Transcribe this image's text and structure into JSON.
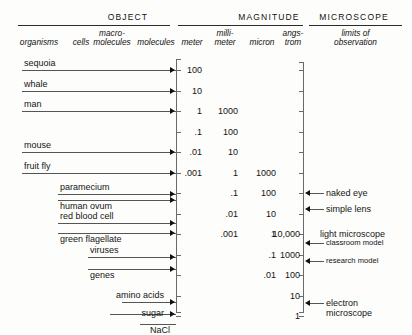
{
  "figure": {
    "groups": [
      {
        "title": "OBJECT"
      },
      {
        "title": "MAGNITUDE"
      },
      {
        "title": "MICROSCOPE"
      }
    ],
    "subheaders": {
      "object": [
        "organisms",
        "cells",
        "macro-molecules",
        "molecules"
      ],
      "magnitude": [
        "meter",
        "milli-meter",
        "micron",
        "angs-trom"
      ],
      "microscope": [
        "limits of observation"
      ]
    }
  },
  "chart_data": {
    "type": "table",
    "xlabel": "",
    "ylabel": "magnitude",
    "grid": false,
    "legend": "none",
    "scale_note": "Each row step is one decimal order of magnitude, from 100 meters down to 1 angstrom.",
    "columns": [
      "organisms",
      "cells",
      "macro-molecules",
      "molecules",
      "meter",
      "millimeter",
      "micron",
      "angstrom",
      "limits of observation"
    ],
    "rows": [
      {
        "meter": "100",
        "millimeter": "",
        "micron": "",
        "angstrom": ""
      },
      {
        "meter": "10",
        "millimeter": "",
        "micron": "",
        "angstrom": ""
      },
      {
        "meter": "1",
        "millimeter": "1000",
        "micron": "",
        "angstrom": ""
      },
      {
        "meter": ".1",
        "millimeter": "100",
        "micron": "",
        "angstrom": ""
      },
      {
        "meter": ".01",
        "millimeter": "10",
        "micron": "",
        "angstrom": ""
      },
      {
        "meter": ".001",
        "millimeter": "1",
        "micron": "1000",
        "angstrom": ""
      },
      {
        "meter": "",
        "millimeter": ".1",
        "micron": "100",
        "angstrom": ""
      },
      {
        "meter": "",
        "millimeter": ".01",
        "micron": "10",
        "angstrom": ""
      },
      {
        "meter": "",
        "millimeter": ".001",
        "micron": "1",
        "angstrom": "10,000"
      },
      {
        "meter": "",
        "millimeter": "",
        "micron": ".1",
        "angstrom": "1000"
      },
      {
        "meter": "",
        "millimeter": "",
        "micron": ".01",
        "angstrom": "100"
      },
      {
        "meter": "",
        "millimeter": "",
        "micron": "",
        "angstrom": "10"
      },
      {
        "meter": "",
        "millimeter": "",
        "micron": "",
        "angstrom": "1"
      }
    ],
    "objects": [
      {
        "label": "sequoia",
        "magnitude_row": 0,
        "category": "organisms"
      },
      {
        "label": "whale",
        "magnitude_row": 1,
        "category": "organisms"
      },
      {
        "label": "man",
        "magnitude_row": 2,
        "category": "organisms"
      },
      {
        "label": "mouse",
        "magnitude_row": 4,
        "category": "organisms"
      },
      {
        "label": "fruit fly",
        "magnitude_row": 5,
        "category": "organisms"
      },
      {
        "label": "paramecium",
        "magnitude_row": 6,
        "category": "cells"
      },
      {
        "label": "human ovum",
        "magnitude_row": 6,
        "category": "cells"
      },
      {
        "label": "red blood cell",
        "magnitude_row": 7,
        "category": "cells"
      },
      {
        "label": "green flagellate",
        "magnitude_row": 8,
        "category": "cells"
      },
      {
        "label": "viruses",
        "magnitude_row": 9,
        "category": "macro-molecules"
      },
      {
        "label": "genes",
        "magnitude_row": 10,
        "category": "macro-molecules"
      },
      {
        "label": "amino acids",
        "magnitude_row": 11,
        "category": "molecules"
      },
      {
        "label": "sugar",
        "magnitude_row": 12,
        "category": "molecules"
      },
      {
        "label": "NaCl",
        "magnitude_row": 12,
        "category": "molecules"
      }
    ],
    "microscope_limits": [
      {
        "label": "naked eye",
        "magnitude_row": 6
      },
      {
        "label": "simple lens",
        "magnitude_row": 7
      },
      {
        "label": "light microscope",
        "magnitude_row": 8,
        "heading": true
      },
      {
        "label": "classroom model",
        "magnitude_row": 8
      },
      {
        "label": "research model",
        "magnitude_row": 9
      },
      {
        "label": "electron microscope",
        "magnitude_row": 11
      }
    ]
  },
  "objects": {
    "sequoia": {
      "label": "sequoia"
    },
    "whale": {
      "label": "whale"
    },
    "man": {
      "label": "man"
    },
    "mouse": {
      "label": "mouse"
    },
    "fruit_fly": {
      "label": "fruit fly"
    },
    "paramecium": {
      "label": "paramecium"
    },
    "human_ovum": {
      "label": "human ovum"
    },
    "red_blood_cell": {
      "label": "red blood cell"
    },
    "green_flagellate": {
      "label": "green flagellate"
    },
    "viruses": {
      "label": "viruses"
    },
    "genes": {
      "label": "genes"
    },
    "amino_acids": {
      "label": "amino acids"
    },
    "sugar": {
      "label": "sugar"
    },
    "nacl": {
      "label": "NaCl"
    }
  },
  "microscope": {
    "naked_eye": {
      "label": "naked eye"
    },
    "simple_lens": {
      "label": "simple lens"
    },
    "light_microscope": {
      "label": "light microscope"
    },
    "classroom_model": {
      "label": "classroom model"
    },
    "research_model": {
      "label": "research model"
    },
    "electron_line1": {
      "label": "electron"
    },
    "electron_line2": {
      "label": "microscope"
    }
  },
  "subheader_text": {
    "organisms": "organisms",
    "cells": "cells",
    "macro_l1": "macro-",
    "macro_l2": "molecules",
    "molecules": "molecules",
    "meter": "meter",
    "milli_l1": "milli-",
    "milli_l2": "meter",
    "micron": "micron",
    "angs_l1": "angs-",
    "angs_l2": "trom",
    "limits_l1": "limits of",
    "limits_l2": "observation"
  },
  "titles": {
    "object": "OBJECT",
    "magnitude": "MAGNITUDE",
    "microscope": "MICROSCOPE"
  },
  "ladder": {
    "meter": [
      "100",
      "10",
      "1",
      ".1",
      ".01",
      ".001"
    ],
    "millimeter": [
      "1000",
      "100",
      "10",
      "1",
      ".1",
      ".01",
      ".001"
    ],
    "micron": [
      "1000",
      "100",
      "10",
      "1",
      ".1",
      ".01"
    ],
    "angstrom": [
      "10,000",
      "1000",
      "100",
      "10",
      "1"
    ]
  }
}
